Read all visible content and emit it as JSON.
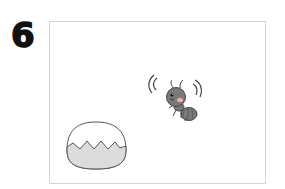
{
  "step_number": "6",
  "scene": {
    "characters": [
      {
        "name": "ant",
        "pose": "bouncing",
        "color": "#7a7a7a",
        "cheek_color": "#f3b0b0"
      }
    ],
    "objects": [
      {
        "name": "bowl-half-filled",
        "fill_color": "#dcdcdc",
        "outline_color": "#555555"
      }
    ]
  }
}
